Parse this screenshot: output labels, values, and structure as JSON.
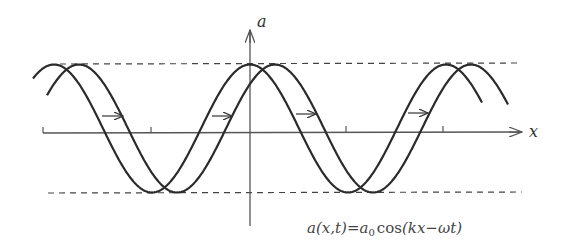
{
  "diagram": {
    "axes": {
      "x_label": "x",
      "y_label": "a"
    },
    "formula": {
      "lhs": "a(x,t)",
      "eq": "=",
      "a": "a",
      "sub": "0",
      "cos": "cos",
      "arg": "(kx−ωt)"
    },
    "elements": {
      "wave_initial": "wave at time t",
      "wave_shifted": "wave at later time, shifted right",
      "amplitude_lines": [
        "+a0 dashed line",
        "−a0 dashed line"
      ],
      "propagation_arrows": 4
    },
    "colors": {
      "stroke": "#2b2b2b",
      "axis": "#555555",
      "dash": "#444444"
    }
  }
}
